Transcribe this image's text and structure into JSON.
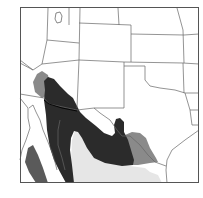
{
  "map": {
    "type": "species range map",
    "region": "Southwestern United States and northern Mexico",
    "colors": {
      "background": "#ffffff",
      "frame": "#555555",
      "borders": "#666666",
      "range_dark": "#2b2b2b",
      "range_medium": "#8a8a8a",
      "range_light": "#e6e6e6",
      "baja_range": "#5a5a5a"
    },
    "legend": []
  }
}
